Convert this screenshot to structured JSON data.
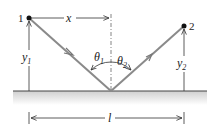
{
  "diagram": {
    "title": "",
    "points": [
      {
        "id": "1",
        "label": "1",
        "x": 29,
        "y": 18
      },
      {
        "id": "2",
        "label": "2",
        "x": 184,
        "y": 26
      }
    ],
    "reflection_point": {
      "x": 111,
      "y": 91
    },
    "labels": {
      "x": "x",
      "y1_main": "y",
      "y1_sub": "1",
      "y2_main": "y",
      "y2_sub": "2",
      "theta1_main": "θ",
      "theta1_sub": "1",
      "theta2_main": "θ",
      "theta2_sub": "2",
      "l": "l"
    },
    "colors": {
      "ray": "#8a8a8a",
      "line": "#333333",
      "ground_shade": "#d8d8d8"
    }
  }
}
